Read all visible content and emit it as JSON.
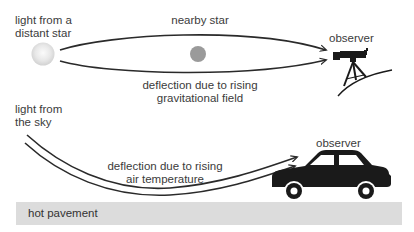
{
  "diagram": {
    "top_section": {
      "source_label_line1": "light from a",
      "source_label_line2": "distant star",
      "lens_label": "nearby star",
      "deflection_label_line1": "deflection due to rising",
      "deflection_label_line2": "gravitational field",
      "observer_label": "observer",
      "observer_icon": "telescope-icon",
      "source_icon": "distant-star-icon",
      "lens_icon": "nearby-star-icon"
    },
    "bottom_section": {
      "source_label_line1": "light from",
      "source_label_line2": "the sky",
      "deflection_label_line1": "deflection due to rising",
      "deflection_label_line2": "air temperature",
      "observer_label": "observer",
      "observer_icon": "car-icon",
      "ground_label": "hot pavement"
    },
    "colors": {
      "stroke": "#2a2a2a",
      "distant_star": "#e6e6e6",
      "nearby_star": "#9a9a9a",
      "pavement": "#dcdcdc",
      "icon_fill": "#1a1a1a"
    }
  }
}
